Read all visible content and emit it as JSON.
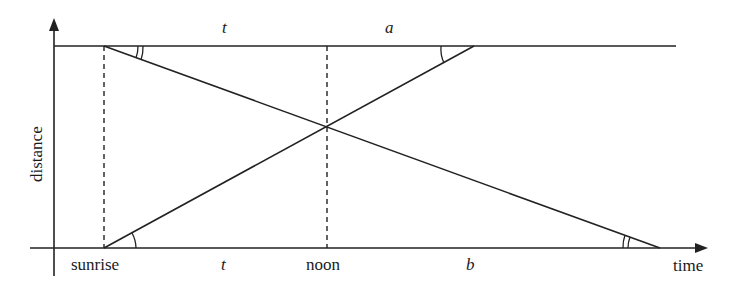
{
  "diagram": {
    "axes": {
      "x_label": "time",
      "y_label": "distance"
    },
    "time_markers": [
      {
        "id": "sunrise",
        "label": "sunrise"
      },
      {
        "id": "noon",
        "label": "noon"
      }
    ],
    "segment_labels": {
      "top_left": "t",
      "top_right": "a",
      "bottom_left": "t",
      "bottom_right": "b"
    },
    "lines": [
      {
        "id": "traveler-a",
        "description": "starts at top distance at sunrise, reaches bottom after noon"
      },
      {
        "id": "traveler-b",
        "description": "starts at bottom distance at sunrise, reaches top before end"
      }
    ],
    "angle_marks": [
      {
        "id": "top-left-angle",
        "arcs": 2
      },
      {
        "id": "top-right-angle",
        "arcs": 1
      },
      {
        "id": "bottom-left-angle",
        "arcs": 1
      },
      {
        "id": "bottom-right-angle",
        "arcs": 2
      }
    ],
    "colors": {
      "stroke": "#222222",
      "background": "#ffffff"
    }
  }
}
